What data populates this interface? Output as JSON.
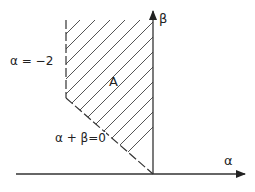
{
  "diagram": {
    "region_label": "A",
    "vertical_boundary_label": "α = −2",
    "diagonal_boundary_label": "α + β=0",
    "x_axis_label": "α",
    "y_axis_label": "β",
    "colors": {
      "line": "#333333",
      "hatch": "#555555",
      "background": "#ffffff"
    }
  }
}
